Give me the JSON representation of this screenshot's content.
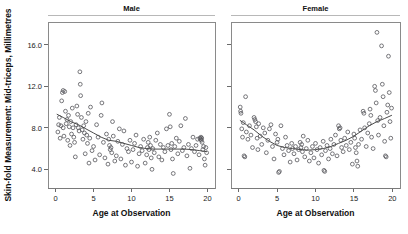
{
  "figure": {
    "ylabel": "Skin-fold Measurement: Mid-triceps, Millimetres",
    "xlabel_left": "Age at Observation",
    "xlabel_right": "Age at Observation",
    "marker_color": "#55555a",
    "line_color": "#4a4a4a",
    "frame_color": "#8a8a8a"
  },
  "chart_data": {
    "type": "scatter",
    "title": "",
    "xlabel": "Age at Observation",
    "ylabel": "Skin-fold Measurement: Mid-triceps, Millimetres",
    "xlim": [
      -1.0,
      21.0
    ],
    "ylim": [
      2.2,
      18.2
    ],
    "xticks": [
      0,
      5,
      10,
      15,
      20
    ],
    "yticks": [
      4.0,
      8.0,
      12.0,
      16.0
    ],
    "xtick_labels": [
      "0",
      "5",
      "10",
      "15",
      "20"
    ],
    "ytick_labels": [
      "4.0",
      "8.0",
      "12.0",
      "16.0"
    ],
    "grid": false,
    "legend": "none",
    "panels": [
      {
        "label": "Male",
        "marker": "open-circle",
        "points": [
          [
            0.3,
            7.6
          ],
          [
            0.4,
            8.3
          ],
          [
            0.5,
            9.0
          ],
          [
            0.6,
            7.0
          ],
          [
            0.7,
            8.2
          ],
          [
            0.8,
            10.6
          ],
          [
            0.9,
            11.4
          ],
          [
            1.0,
            11.6
          ],
          [
            1.0,
            8.0
          ],
          [
            1.1,
            7.2
          ],
          [
            1.2,
            11.5
          ],
          [
            1.3,
            9.6
          ],
          [
            1.4,
            8.4
          ],
          [
            1.5,
            8.8
          ],
          [
            1.6,
            6.8
          ],
          [
            1.7,
            9.2
          ],
          [
            1.8,
            8.1
          ],
          [
            1.9,
            6.3
          ],
          [
            2.0,
            8.6
          ],
          [
            2.1,
            7.4
          ],
          [
            2.2,
            9.9
          ],
          [
            2.3,
            8.0
          ],
          [
            2.4,
            7.1
          ],
          [
            2.5,
            6.6
          ],
          [
            2.6,
            5.2
          ],
          [
            2.7,
            8.3
          ],
          [
            2.8,
            10.1
          ],
          [
            2.9,
            9.3
          ],
          [
            3.0,
            8.0
          ],
          [
            3.1,
            7.7
          ],
          [
            3.2,
            13.4
          ],
          [
            3.25,
            12.2
          ],
          [
            3.3,
            11.1
          ],
          [
            3.4,
            9.0
          ],
          [
            3.5,
            7.8
          ],
          [
            3.6,
            6.9
          ],
          [
            3.7,
            8.2
          ],
          [
            3.8,
            7.5
          ],
          [
            3.9,
            5.5
          ],
          [
            4.0,
            8.6
          ],
          [
            4.1,
            7.3
          ],
          [
            4.2,
            6.5
          ],
          [
            4.3,
            9.4
          ],
          [
            4.4,
            4.6
          ],
          [
            4.5,
            7.0
          ],
          [
            4.6,
            10.0
          ],
          [
            4.8,
            5.8
          ],
          [
            5.0,
            6.2
          ],
          [
            5.2,
            4.9
          ],
          [
            5.4,
            8.3
          ],
          [
            5.6,
            7.1
          ],
          [
            5.8,
            5.4
          ],
          [
            6.0,
            9.2
          ],
          [
            6.1,
            10.4
          ],
          [
            6.3,
            6.6
          ],
          [
            6.5,
            5.1
          ],
          [
            6.7,
            7.4
          ],
          [
            6.9,
            4.5
          ],
          [
            7.0,
            6.9
          ],
          [
            7.1,
            6.3
          ],
          [
            7.2,
            5.9
          ],
          [
            7.3,
            6.1
          ],
          [
            7.4,
            5.6
          ],
          [
            7.5,
            8.6
          ],
          [
            7.6,
            7.2
          ],
          [
            7.8,
            4.8
          ],
          [
            8.0,
            5.3
          ],
          [
            8.2,
            6.7
          ],
          [
            8.4,
            7.9
          ],
          [
            8.6,
            5.0
          ],
          [
            8.8,
            6.4
          ],
          [
            9.0,
            7.7
          ],
          [
            9.2,
            4.4
          ],
          [
            9.4,
            6.0
          ],
          [
            9.6,
            5.7
          ],
          [
            9.8,
            6.8
          ],
          [
            10.0,
            4.7
          ],
          [
            10.2,
            5.9
          ],
          [
            10.4,
            6.5
          ],
          [
            10.6,
            7.3
          ],
          [
            10.8,
            4.3
          ],
          [
            11.0,
            5.5
          ],
          [
            11.2,
            6.2
          ],
          [
            11.4,
            5.8
          ],
          [
            11.6,
            6.9
          ],
          [
            11.8,
            4.6
          ],
          [
            12.0,
            5.4
          ],
          [
            12.1,
            6.1
          ],
          [
            12.2,
            6.6
          ],
          [
            12.3,
            5.9
          ],
          [
            12.4,
            7.1
          ],
          [
            12.5,
            6.3
          ],
          [
            12.6,
            5.1
          ],
          [
            12.7,
            4.0
          ],
          [
            12.8,
            6.0
          ],
          [
            13.0,
            5.6
          ],
          [
            13.2,
            6.8
          ],
          [
            13.4,
            7.5
          ],
          [
            13.6,
            5.2
          ],
          [
            13.8,
            6.4
          ],
          [
            14.0,
            4.9
          ],
          [
            14.2,
            6.1
          ],
          [
            14.4,
            5.7
          ],
          [
            14.6,
            7.9
          ],
          [
            14.8,
            6.3
          ],
          [
            15.0,
            9.3
          ],
          [
            15.1,
            8.1
          ],
          [
            15.2,
            5.9
          ],
          [
            15.3,
            6.5
          ],
          [
            15.4,
            5.0
          ],
          [
            15.5,
            3.6
          ],
          [
            15.7,
            6.2
          ],
          [
            15.9,
            7.0
          ],
          [
            16.1,
            5.5
          ],
          [
            16.3,
            6.7
          ],
          [
            16.5,
            8.2
          ],
          [
            16.7,
            5.8
          ],
          [
            16.9,
            6.1
          ],
          [
            17.1,
            8.9
          ],
          [
            17.3,
            5.3
          ],
          [
            17.5,
            6.4
          ],
          [
            17.7,
            4.1
          ],
          [
            17.9,
            6.0
          ],
          [
            18.1,
            7.1
          ],
          [
            18.3,
            5.7
          ],
          [
            18.5,
            6.3
          ],
          [
            18.7,
            6.9
          ],
          [
            18.9,
            5.4
          ],
          [
            19.0,
            7.0
          ],
          [
            19.1,
            6.9
          ],
          [
            19.15,
            7.1
          ],
          [
            19.2,
            6.8
          ],
          [
            19.25,
            7.0
          ],
          [
            19.3,
            6.6
          ],
          [
            19.4,
            5.9
          ],
          [
            19.5,
            6.2
          ],
          [
            19.6,
            5.0
          ],
          [
            19.7,
            4.4
          ],
          [
            19.8,
            6.1
          ],
          [
            19.9,
            5.6
          ]
        ],
        "smooth": [
          [
            0.2,
            9.3
          ],
          [
            1.0,
            9.0
          ],
          [
            2.0,
            8.6
          ],
          [
            3.0,
            8.3
          ],
          [
            4.0,
            7.9
          ],
          [
            5.0,
            7.5
          ],
          [
            6.0,
            7.1
          ],
          [
            7.0,
            6.8
          ],
          [
            8.0,
            6.7
          ],
          [
            9.0,
            6.5
          ],
          [
            10.0,
            6.3
          ],
          [
            11.0,
            6.1
          ],
          [
            12.0,
            6.0
          ],
          [
            13.0,
            5.95
          ],
          [
            14.0,
            5.95
          ],
          [
            15.0,
            5.95
          ],
          [
            16.0,
            5.95
          ],
          [
            17.0,
            5.95
          ],
          [
            18.0,
            5.9
          ],
          [
            19.0,
            5.8
          ],
          [
            19.9,
            5.7
          ]
        ]
      },
      {
        "label": "Female",
        "marker": "open-circle",
        "points": [
          [
            0.2,
            10.0
          ],
          [
            0.25,
            9.6
          ],
          [
            0.3,
            9.4
          ],
          [
            0.4,
            7.9
          ],
          [
            0.5,
            7.1
          ],
          [
            0.6,
            8.5
          ],
          [
            0.7,
            5.3
          ],
          [
            0.8,
            5.2
          ],
          [
            0.9,
            11.0
          ],
          [
            1.0,
            7.6
          ],
          [
            1.2,
            6.9
          ],
          [
            1.4,
            8.2
          ],
          [
            1.6,
            7.3
          ],
          [
            1.8,
            6.1
          ],
          [
            2.0,
            9.0
          ],
          [
            2.1,
            8.8
          ],
          [
            2.2,
            8.6
          ],
          [
            2.3,
            8.1
          ],
          [
            2.4,
            7.0
          ],
          [
            2.5,
            5.9
          ],
          [
            2.6,
            8.4
          ],
          [
            2.8,
            7.2
          ],
          [
            3.0,
            6.4
          ],
          [
            3.2,
            8.0
          ],
          [
            3.4,
            7.5
          ],
          [
            3.6,
            5.6
          ],
          [
            3.8,
            6.8
          ],
          [
            4.0,
            7.9
          ],
          [
            4.2,
            8.3
          ],
          [
            4.4,
            6.2
          ],
          [
            4.6,
            5.0
          ],
          [
            4.8,
            7.4
          ],
          [
            5.0,
            6.6
          ],
          [
            5.1,
            6.9
          ],
          [
            5.2,
            3.7
          ],
          [
            5.3,
            3.8
          ],
          [
            5.5,
            8.2
          ],
          [
            5.7,
            6.0
          ],
          [
            5.9,
            5.4
          ],
          [
            6.1,
            7.1
          ],
          [
            6.3,
            6.3
          ],
          [
            6.5,
            5.8
          ],
          [
            6.7,
            4.7
          ],
          [
            6.9,
            6.5
          ],
          [
            7.0,
            6.0
          ],
          [
            7.2,
            5.5
          ],
          [
            7.4,
            6.2
          ],
          [
            7.6,
            4.9
          ],
          [
            7.8,
            5.9
          ],
          [
            8.0,
            6.6
          ],
          [
            8.1,
            6.1
          ],
          [
            8.2,
            6.4
          ],
          [
            8.3,
            5.7
          ],
          [
            8.4,
            7.2
          ],
          [
            8.6,
            5.2
          ],
          [
            8.8,
            6.0
          ],
          [
            9.0,
            6.8
          ],
          [
            9.2,
            4.8
          ],
          [
            9.4,
            5.6
          ],
          [
            9.6,
            6.2
          ],
          [
            9.8,
            5.1
          ],
          [
            10.0,
            6.5
          ],
          [
            10.2,
            5.9
          ],
          [
            10.4,
            4.6
          ],
          [
            10.6,
            6.1
          ],
          [
            10.8,
            5.4
          ],
          [
            11.0,
            6.7
          ],
          [
            11.1,
            3.9
          ],
          [
            11.2,
            3.8
          ],
          [
            11.3,
            5.8
          ],
          [
            11.5,
            6.3
          ],
          [
            11.7,
            5.0
          ],
          [
            11.9,
            6.0
          ],
          [
            12.0,
            6.9
          ],
          [
            12.2,
            5.5
          ],
          [
            12.4,
            6.4
          ],
          [
            12.6,
            7.3
          ],
          [
            12.8,
            5.3
          ],
          [
            13.0,
            8.2
          ],
          [
            13.1,
            7.9
          ],
          [
            13.2,
            8.0
          ],
          [
            13.3,
            6.8
          ],
          [
            13.4,
            6.1
          ],
          [
            13.6,
            5.7
          ],
          [
            13.8,
            7.0
          ],
          [
            14.0,
            6.3
          ],
          [
            14.2,
            7.6
          ],
          [
            14.4,
            5.9
          ],
          [
            14.6,
            6.6
          ],
          [
            14.8,
            4.5
          ],
          [
            15.0,
            7.4
          ],
          [
            15.1,
            7.0
          ],
          [
            15.2,
            6.1
          ],
          [
            15.3,
            5.6
          ],
          [
            15.4,
            4.8
          ],
          [
            15.5,
            4.3
          ],
          [
            15.6,
            6.4
          ],
          [
            15.8,
            7.8
          ],
          [
            16.0,
            6.9
          ],
          [
            16.2,
            9.6
          ],
          [
            16.3,
            9.4
          ],
          [
            16.4,
            8.0
          ],
          [
            16.6,
            6.2
          ],
          [
            16.8,
            7.5
          ],
          [
            17.0,
            8.4
          ],
          [
            17.1,
            9.8
          ],
          [
            17.2,
            9.2
          ],
          [
            17.3,
            7.1
          ],
          [
            17.5,
            6.0
          ],
          [
            17.7,
            12.0
          ],
          [
            17.8,
            11.6
          ],
          [
            17.9,
            10.4
          ],
          [
            18.0,
            17.2
          ],
          [
            18.1,
            8.7
          ],
          [
            18.2,
            7.3
          ],
          [
            18.4,
            9.0
          ],
          [
            18.6,
            15.9
          ],
          [
            18.7,
            12.2
          ],
          [
            18.8,
            11.0
          ],
          [
            18.9,
            8.2
          ],
          [
            19.0,
            6.7
          ],
          [
            19.1,
            5.3
          ],
          [
            19.2,
            5.2
          ],
          [
            19.3,
            9.5
          ],
          [
            19.4,
            10.2
          ],
          [
            19.5,
            14.9
          ],
          [
            19.6,
            11.4
          ],
          [
            19.7,
            8.6
          ],
          [
            19.8,
            7.0
          ],
          [
            19.9,
            9.9
          ]
        ],
        "smooth": [
          [
            0.2,
            8.7
          ],
          [
            1.0,
            8.3
          ],
          [
            2.0,
            7.8
          ],
          [
            3.0,
            7.2
          ],
          [
            4.0,
            6.7
          ],
          [
            5.0,
            6.3
          ],
          [
            6.0,
            6.1
          ],
          [
            7.0,
            6.0
          ],
          [
            8.0,
            5.9
          ],
          [
            9.0,
            5.85
          ],
          [
            10.0,
            5.9
          ],
          [
            11.0,
            6.0
          ],
          [
            12.0,
            6.2
          ],
          [
            13.0,
            6.5
          ],
          [
            14.0,
            6.8
          ],
          [
            15.0,
            7.2
          ],
          [
            16.0,
            7.7
          ],
          [
            17.0,
            8.2
          ],
          [
            18.0,
            8.6
          ],
          [
            19.0,
            8.9
          ],
          [
            19.9,
            9.2
          ]
        ]
      }
    ]
  }
}
